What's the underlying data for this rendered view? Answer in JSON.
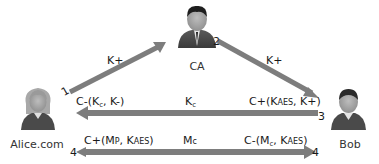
{
  "diagram": {
    "actors": {
      "ca": {
        "name": "CA"
      },
      "alice": {
        "name": "Alice.com"
      },
      "bob": {
        "name": "Bob"
      }
    },
    "edges": [
      {
        "id": "alice-to-ca",
        "step": "1",
        "label": "K+",
        "from": "Alice.com",
        "to": "CA"
      },
      {
        "id": "ca-to-bob",
        "step": "2",
        "label": "K+",
        "from": "CA",
        "to": "Bob"
      },
      {
        "id": "bob-to-alice",
        "step": "3",
        "label": "Kc",
        "label_main": "K",
        "label_sub": "c",
        "from": "Bob",
        "to": "Alice.com",
        "left_label": {
          "prefix": "C-(K",
          "sub": "c",
          "suffix": ", K-)"
        },
        "right_label": {
          "prefix": "C+(K",
          "sc": "AES",
          "suffix": ", K+)"
        }
      },
      {
        "id": "alice-to-bob",
        "step": "4",
        "label": "Mc",
        "label_main": "M",
        "label_sc": "c",
        "from": "Alice.com",
        "to": "Bob",
        "left_label": {
          "prefix": "C+(M",
          "sc1": "P",
          "mid": ", K",
          "sc2": "AES",
          "suffix": ")"
        },
        "right_label": {
          "prefix": "C-(M",
          "sub": "c",
          "mid": ", K",
          "sc": "AES",
          "suffix": ")"
        }
      }
    ],
    "step_numbers": {
      "one": "1",
      "two": "2",
      "three": "3",
      "four_left": "4",
      "four_right": "4"
    },
    "colors": {
      "arrow": "#7a7a7a",
      "arrow_dark": "#5e5e5e",
      "text": "#1a1a1a"
    }
  }
}
